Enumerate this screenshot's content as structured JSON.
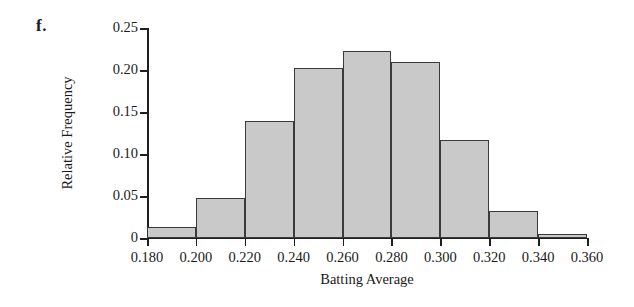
{
  "figure": {
    "part_label": "f."
  },
  "chart_data": {
    "type": "bar",
    "title": "",
    "subtitle": "",
    "xlabel": "Batting Average",
    "ylabel": "Relative Frequency",
    "xlim": [
      0.18,
      0.36
    ],
    "ylim": [
      0,
      0.25
    ],
    "grid": false,
    "legend": null,
    "bin_width": 0.02,
    "x_tick_labels": [
      "0.180",
      "0.200",
      "0.220",
      "0.240",
      "0.260",
      "0.280",
      "0.300",
      "0.320",
      "0.340",
      "0.360"
    ],
    "x_tick_values": [
      0.18,
      0.2,
      0.22,
      0.24,
      0.26,
      0.28,
      0.3,
      0.32,
      0.34,
      0.36
    ],
    "y_tick_labels": [
      "0",
      "0.05",
      "0.10",
      "0.15",
      "0.20",
      "0.25"
    ],
    "y_tick_values": [
      0,
      0.05,
      0.1,
      0.15,
      0.2,
      0.25
    ],
    "categories": [
      "0.180-0.200",
      "0.200-0.220",
      "0.220-0.240",
      "0.240-0.260",
      "0.260-0.280",
      "0.280-0.300",
      "0.300-0.320",
      "0.320-0.340",
      "0.340-0.360"
    ],
    "bin_edges": [
      0.18,
      0.2,
      0.22,
      0.24,
      0.26,
      0.28,
      0.3,
      0.32,
      0.34,
      0.36
    ],
    "values": [
      0.013,
      0.048,
      0.139,
      0.202,
      0.223,
      0.209,
      0.117,
      0.032,
      0.005
    ],
    "bar_color": "#c9c9c9",
    "bar_edge_color": "#3a3a3a",
    "axis_color": "#1f1f1f"
  }
}
